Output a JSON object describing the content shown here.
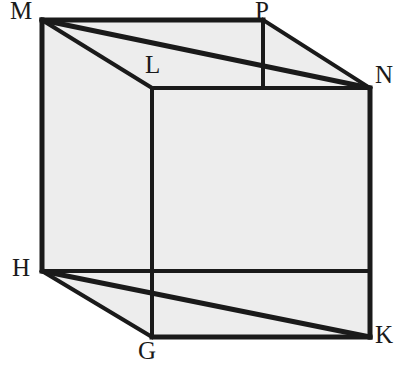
{
  "figure": {
    "kind": "geometric-solid-diagram",
    "solid": "cube",
    "width": 405,
    "height": 383,
    "colors": {
      "background": "#ffffff",
      "face_fill": "#ededed",
      "edge_stroke": "#1a1a1a",
      "label_color": "#1a1a1a"
    },
    "stroke_widths": {
      "outline": 5,
      "edge": 4,
      "diagonal": 5
    }
  },
  "vertices": [
    {
      "name": "M",
      "label": "M",
      "x": 42,
      "y": 20,
      "label_x": 10,
      "label_y": -2,
      "position": "top-back-left"
    },
    {
      "name": "P",
      "label": "P",
      "x": 263,
      "y": 20,
      "label_x": 255,
      "label_y": -2,
      "position": "top-back-right"
    },
    {
      "name": "L",
      "label": "L",
      "x": 152,
      "y": 88,
      "label_x": 145,
      "label_y": 52,
      "position": "top-front-left"
    },
    {
      "name": "N",
      "label": "N",
      "x": 370,
      "y": 88,
      "label_x": 375,
      "label_y": 62,
      "position": "top-front-right"
    },
    {
      "name": "H",
      "label": "H",
      "x": 42,
      "y": 271,
      "label_x": 12,
      "label_y": 255,
      "position": "bottom-back-left"
    },
    {
      "name": "G",
      "label": "G",
      "x": 152,
      "y": 337,
      "label_x": 138,
      "label_y": 338,
      "position": "bottom-front-left"
    },
    {
      "name": "K",
      "label": "K",
      "x": 370,
      "y": 337,
      "label_x": 375,
      "label_y": 322,
      "position": "bottom-front-right"
    }
  ],
  "edges": [
    {
      "name": "M-P",
      "from": "M",
      "to": "P",
      "style": "solid",
      "role": "top-back-edge"
    },
    {
      "name": "M-L",
      "from": "M",
      "to": "L",
      "style": "solid",
      "role": "top-left-receding-edge"
    },
    {
      "name": "L-N",
      "from": "L",
      "to": "N",
      "style": "solid",
      "role": "top-front-edge"
    },
    {
      "name": "P-N",
      "from": "P",
      "to": "N",
      "style": "solid",
      "role": "top-right-receding-edge"
    },
    {
      "name": "M-H",
      "from": "M",
      "to": "H",
      "style": "solid",
      "role": "left-back-vertical-edge"
    },
    {
      "name": "L-G",
      "from": "L",
      "to": "G",
      "style": "solid",
      "role": "left-front-vertical-edge"
    },
    {
      "name": "N-K",
      "from": "N",
      "to": "K",
      "style": "solid",
      "role": "right-front-vertical-edge"
    },
    {
      "name": "H-G",
      "from": "H",
      "to": "G",
      "style": "solid",
      "role": "bottom-left-receding-edge"
    },
    {
      "name": "G-K",
      "from": "G",
      "to": "K",
      "style": "solid",
      "role": "bottom-front-edge"
    },
    {
      "name": "H-K-outline",
      "from": "H",
      "to": "K",
      "style": "solid",
      "role": "bottom-silhouette-edge"
    }
  ],
  "diagonals": [
    {
      "name": "M-N",
      "from": "M",
      "to": "N",
      "style": "solid",
      "role": "top-face-diagonal"
    },
    {
      "name": "H-K",
      "from": "H",
      "to": "K",
      "style": "solid",
      "role": "bottom-face-diagonal"
    }
  ],
  "faces": [
    {
      "name": "top-face",
      "vertices": [
        "M",
        "P",
        "N",
        "L"
      ],
      "shaded": true
    },
    {
      "name": "left-face",
      "vertices": [
        "M",
        "L",
        "G",
        "H"
      ],
      "shaded": true
    },
    {
      "name": "front-face",
      "vertices": [
        "L",
        "N",
        "K",
        "G"
      ],
      "shaded": true
    },
    {
      "name": "right-face",
      "vertices": [
        "P",
        "N",
        "K"
      ],
      "shaded": true
    }
  ],
  "silhouette": {
    "name": "cube-outline",
    "points": "42,20 263,20 370,88 370,337 152,337 42,271",
    "fill": "#ededed"
  }
}
